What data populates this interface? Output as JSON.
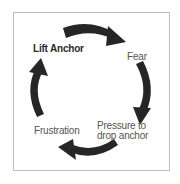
{
  "diagram": {
    "type": "cycle",
    "direction": "clockwise",
    "colors": {
      "arrow": "#262626",
      "border": "#bdbdbd",
      "text": "#555555",
      "text_bold": "#2a2a2a",
      "background": "#ffffff"
    },
    "nodes": [
      {
        "id": "lift-anchor",
        "label": "Lift Anchor",
        "bold": true
      },
      {
        "id": "fear",
        "label": "Fear",
        "bold": false
      },
      {
        "id": "pressure",
        "label_line1": "Pressure to",
        "label_line2": "drop anchor",
        "bold": false
      },
      {
        "id": "frustration",
        "label": "Frustration",
        "bold": false
      }
    ],
    "edges": [
      {
        "from": "lift-anchor",
        "to": "fear"
      },
      {
        "from": "fear",
        "to": "pressure"
      },
      {
        "from": "pressure",
        "to": "frustration"
      },
      {
        "from": "frustration",
        "to": "lift-anchor"
      }
    ]
  }
}
